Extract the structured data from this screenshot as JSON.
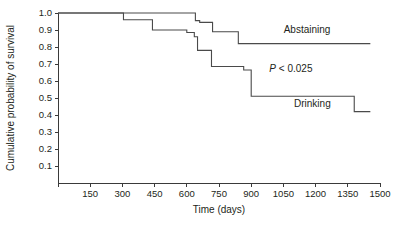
{
  "chart_data": {
    "type": "line",
    "subtype": "kaplan-meier-step",
    "title": "",
    "xlabel": "Time (days)",
    "ylabel": "Cumulative probability of survival",
    "xlim": [
      0,
      1500
    ],
    "ylim": [
      0,
      1.0
    ],
    "grid": false,
    "legend_position": "inline-right",
    "x_ticks": [
      0,
      150,
      300,
      450,
      600,
      750,
      900,
      1050,
      1200,
      1350,
      1500
    ],
    "x_tick_labels": [
      "",
      "150",
      "300",
      "450",
      "600",
      "750",
      "900",
      "1050",
      "1200",
      "1350",
      "1500"
    ],
    "y_ticks": [
      0.1,
      0.2,
      0.3,
      0.4,
      0.5,
      0.6,
      0.7,
      0.8,
      0.9,
      1.0
    ],
    "y_tick_labels": [
      "0.1",
      "0.2",
      "0.3",
      "0.4",
      "0.5",
      "0.6",
      "0.7",
      "0.8",
      "0.9",
      "1.0"
    ],
    "series": [
      {
        "name": "Abstaining",
        "label": "Abstaining",
        "color": "#4a4a4a",
        "label_x": 1160,
        "label_y": 0.885,
        "x": [
          0,
          640,
          640,
          660,
          660,
          720,
          720,
          840,
          840,
          1455
        ],
        "y": [
          1.0,
          1.0,
          0.955,
          0.955,
          0.945,
          0.945,
          0.89,
          0.89,
          0.82,
          0.82
        ],
        "steps": [
          {
            "time": 0,
            "survival": 1.0
          },
          {
            "time": 640,
            "survival": 0.955
          },
          {
            "time": 660,
            "survival": 0.945
          },
          {
            "time": 720,
            "survival": 0.89
          },
          {
            "time": 840,
            "survival": 0.82
          },
          {
            "time": 1455,
            "survival": 0.82
          }
        ]
      },
      {
        "name": "Drinking",
        "label": "Drinking",
        "color": "#4a4a4a",
        "label_x": 1185,
        "label_y": 0.445,
        "x": [
          0,
          305,
          305,
          440,
          440,
          600,
          600,
          635,
          635,
          650,
          650,
          715,
          715,
          865,
          865,
          900,
          900,
          1380,
          1380,
          1455
        ],
        "y": [
          1.0,
          1.0,
          0.96,
          0.96,
          0.9,
          0.9,
          0.885,
          0.885,
          0.86,
          0.86,
          0.78,
          0.78,
          0.685,
          0.685,
          0.665,
          0.665,
          0.51,
          0.51,
          0.42,
          0.42
        ],
        "steps": [
          {
            "time": 0,
            "survival": 1.0
          },
          {
            "time": 305,
            "survival": 0.96
          },
          {
            "time": 440,
            "survival": 0.9
          },
          {
            "time": 600,
            "survival": 0.885
          },
          {
            "time": 635,
            "survival": 0.86
          },
          {
            "time": 650,
            "survival": 0.78
          },
          {
            "time": 715,
            "survival": 0.685
          },
          {
            "time": 865,
            "survival": 0.665
          },
          {
            "time": 900,
            "survival": 0.51
          },
          {
            "time": 1380,
            "survival": 0.42
          },
          {
            "time": 1455,
            "survival": 0.42
          }
        ]
      }
    ],
    "annotations": [
      {
        "name": "p-value",
        "text": "P < 0.025",
        "italic_prefix": "P",
        "rest": " < 0.025",
        "x": 1085,
        "y": 0.655
      }
    ]
  }
}
